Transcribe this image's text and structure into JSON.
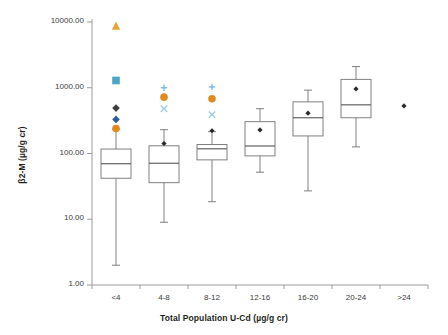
{
  "chart_data": {
    "type": "box",
    "title": "",
    "xlabel": "Total Population U-Cd (µg/g cr)",
    "ylabel": "β2-M (µg/g cr)",
    "yscale": "log",
    "ylim": [
      1.0,
      10000.0
    ],
    "ytick_labels": [
      "10000.00",
      "1000.00",
      "100.00",
      "10.00",
      "1.00"
    ],
    "ytick_values": [
      10000,
      1000,
      100,
      10,
      1
    ],
    "grid": false,
    "legend": "none",
    "categories": [
      "<4",
      "4-8",
      "8-12",
      "12-16",
      "16-20",
      "20-24",
      ">24"
    ],
    "boxes": [
      {
        "category": "<4",
        "whisker_low": 2.0,
        "q1": 42.0,
        "median": 70.0,
        "q3": 117.0,
        "whisker_high": 235.0,
        "mean": null,
        "outliers": [
          {
            "value": 8600,
            "marker": "triangle",
            "color": "#e8a33d"
          },
          {
            "value": 1290,
            "marker": "square",
            "color": "#4da6c8"
          },
          {
            "value": 490,
            "marker": "diamond",
            "color": "#3f3f3f"
          },
          {
            "value": 330,
            "marker": "diamond",
            "color": "#2f5c9e"
          },
          {
            "value": 240,
            "marker": "circle",
            "color": "#e08a1e"
          }
        ]
      },
      {
        "category": "4-8",
        "whisker_low": 9.0,
        "q1": 36.0,
        "median": 71.0,
        "q3": 131.0,
        "whisker_high": 230.0,
        "mean": 142.0,
        "outliers": [
          {
            "value": 1000,
            "marker": "plus",
            "color": "#7fb8dd"
          },
          {
            "value": 720,
            "marker": "circle",
            "color": "#e08a1e"
          },
          {
            "value": 480,
            "marker": "x",
            "color": "#9dcbe8"
          }
        ]
      },
      {
        "category": "8-12",
        "whisker_low": 18.5,
        "q1": 80.0,
        "median": 118.0,
        "q3": 137.0,
        "whisker_high": 215.0,
        "mean": 222.0,
        "outliers": [
          {
            "value": 1030,
            "marker": "plus",
            "color": "#7fb8dd"
          },
          {
            "value": 680,
            "marker": "circle",
            "color": "#e08a1e"
          },
          {
            "value": 390,
            "marker": "x",
            "color": "#9dcbe8"
          }
        ]
      },
      {
        "category": "12-16",
        "whisker_low": 52.0,
        "q1": 92.0,
        "median": 130.0,
        "q3": 305.0,
        "whisker_high": 480.0,
        "mean": 228.0,
        "outliers": []
      },
      {
        "category": "16-20",
        "whisker_low": 27.0,
        "q1": 185.0,
        "median": 350.0,
        "q3": 610.0,
        "whisker_high": 920.0,
        "mean": 410.0,
        "outliers": []
      },
      {
        "category": "20-24",
        "whisker_low": 126.0,
        "q1": 350.0,
        "median": 550.0,
        "q3": 1340.0,
        "whisker_high": 2100.0,
        "mean": 960.0,
        "outliers": []
      },
      {
        "category": ">24",
        "whisker_low": null,
        "q1": null,
        "median": null,
        "q3": null,
        "whisker_high": null,
        "mean": 530.0,
        "outliers": []
      }
    ]
  }
}
